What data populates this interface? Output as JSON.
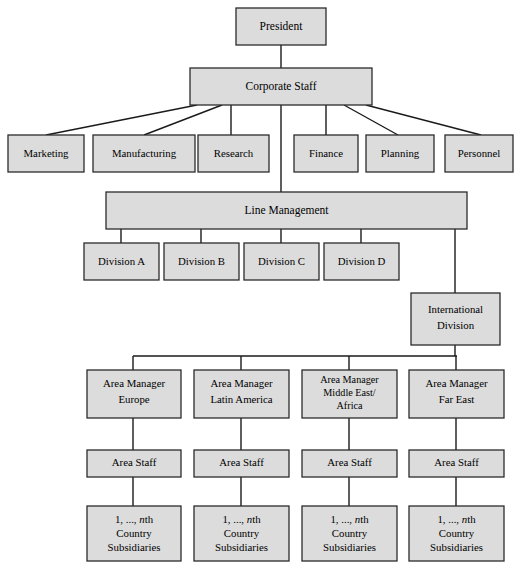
{
  "diagram": {
    "type": "organization-chart",
    "box_fill": "#dcdcdc",
    "box_stroke": "#2b2b2b",
    "line_color": "#1a1a1a",
    "background": "#ffffff"
  },
  "nodes": {
    "president": {
      "label": "President"
    },
    "corporate_staff": {
      "label": "Corporate Staff"
    },
    "departments": [
      {
        "label": "Marketing"
      },
      {
        "label": "Manufacturing"
      },
      {
        "label": "Research"
      },
      {
        "label": "Finance"
      },
      {
        "label": "Planning"
      },
      {
        "label": "Personnel"
      }
    ],
    "line_management": {
      "label": "Line Management"
    },
    "divisions": [
      {
        "label": "Division A"
      },
      {
        "label": "Division B"
      },
      {
        "label": "Division C"
      },
      {
        "label": "Division D"
      }
    ],
    "international_division": {
      "line1": "International",
      "line2": "Division"
    },
    "area_managers": [
      {
        "line1": "Area Manager",
        "line2": "Europe",
        "line3": ""
      },
      {
        "line1": "Area Manager",
        "line2": "Latin America",
        "line3": ""
      },
      {
        "line1": "Area Manager",
        "line2": "Middle East/",
        "line3": "Africa"
      },
      {
        "line1": "Area Manager",
        "line2": "Far East",
        "line3": ""
      }
    ],
    "area_staff": [
      {
        "label": "Area Staff"
      },
      {
        "label": "Area Staff"
      },
      {
        "label": "Area Staff"
      },
      {
        "label": "Area Staff"
      }
    ],
    "country_subsidiaries": [
      {
        "line1_pre": "1, ..., ",
        "line1_italic": "n",
        "line1_post": "th",
        "line2": "Country",
        "line3": "Subsidiaries"
      },
      {
        "line1_pre": "1, ..., ",
        "line1_italic": "n",
        "line1_post": "th",
        "line2": "Country",
        "line3": "Subsidiaries"
      },
      {
        "line1_pre": "1, ..., ",
        "line1_italic": "n",
        "line1_post": "th",
        "line2": "Country",
        "line3": "Subsidiaries"
      },
      {
        "line1_pre": "1, ..., ",
        "line1_italic": "n",
        "line1_post": "th",
        "line2": "Country",
        "line3": "Subsidiaries"
      }
    ]
  }
}
